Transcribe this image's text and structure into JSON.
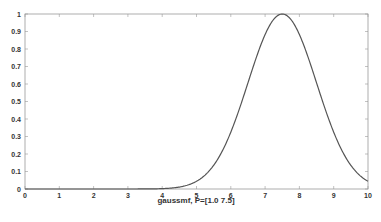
{
  "chart_data": {
    "type": "line",
    "title": "",
    "xlabel": "gaussmf, P=[1.0  7.5]",
    "ylabel": "",
    "xlim": [
      0,
      10
    ],
    "ylim": [
      0,
      1
    ],
    "x_ticks": [
      "0",
      "1",
      "2",
      "3",
      "4",
      "5",
      "6",
      "7",
      "8",
      "9",
      "10"
    ],
    "y_ticks": [
      "0",
      "0.1",
      "0.2",
      "0.3",
      "0.4",
      "0.5",
      "0.6",
      "0.7",
      "0.8",
      "0.9",
      "1"
    ],
    "grid": false,
    "legend": null,
    "series": [
      {
        "name": "gaussmf",
        "function": "gaussian",
        "params": {
          "sigma": 1.0,
          "c": 7.5
        },
        "color": "#555555",
        "x": [
          0,
          1,
          2,
          3,
          4,
          4.5,
          5,
          5.5,
          6,
          6.5,
          7,
          7.5,
          8,
          8.5,
          9,
          9.5,
          10
        ],
        "values": [
          0.0,
          0.0,
          0.0,
          0.0,
          0.002,
          0.011,
          0.044,
          0.135,
          0.325,
          0.607,
          0.882,
          1.0,
          0.882,
          0.607,
          0.325,
          0.135,
          0.044
        ]
      }
    ]
  },
  "colors": {
    "axis": "#999999",
    "line": "#555555",
    "text": "#333333",
    "background": "#ffffff"
  }
}
